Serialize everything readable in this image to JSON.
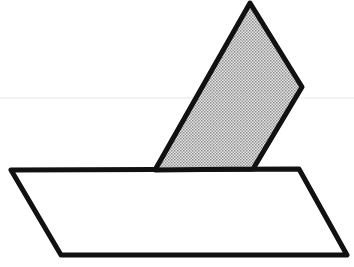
{
  "diagram": {
    "colors": {
      "stroke": "#111111",
      "shade": "#bdbdbd",
      "background": "#ffffff",
      "guide": "#e6e6e6"
    },
    "base_plane": {
      "points": "11,170 299,169 347,255 61,255"
    },
    "inclined_plane": {
      "points": "155,170 250,3 302,87 253,169"
    },
    "guide_line": {
      "x1": 0,
      "y1": 98,
      "x2": 354,
      "y2": 98
    }
  }
}
